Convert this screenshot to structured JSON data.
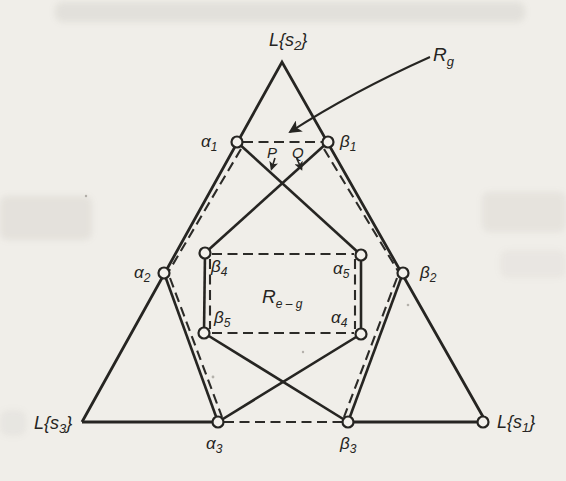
{
  "figure": {
    "title_hint": "Triangle diagram with regions R_g and R_e-g",
    "paper_color": "#f0eee9",
    "ink_color": "#262522",
    "vertex_labels": {
      "ls2": {
        "pre": "L{s",
        "sub": "2",
        "post": "}"
      },
      "ls3": {
        "pre": "L{s",
        "sub": "3",
        "post": "}"
      },
      "ls1": {
        "pre": "L{s",
        "sub": "1",
        "post": "}"
      }
    },
    "region_labels": {
      "rg": {
        "pre": "R",
        "sub": "g"
      },
      "reg": {
        "pre": "R",
        "sub": "e – g"
      }
    },
    "point_labels": {
      "alpha1": {
        "pre": "α",
        "sub": "1"
      },
      "beta1": {
        "pre": "β",
        "sub": "1"
      },
      "alpha2": {
        "pre": "α",
        "sub": "2"
      },
      "beta2": {
        "pre": "β",
        "sub": "2"
      },
      "alpha3": {
        "pre": "α",
        "sub": "3"
      },
      "beta3": {
        "pre": "β",
        "sub": "3"
      },
      "alpha4": {
        "pre": "α",
        "sub": "4"
      },
      "beta4": {
        "pre": "β",
        "sub": "4"
      },
      "alpha5": {
        "pre": "α",
        "sub": "5"
      },
      "beta5": {
        "pre": "β",
        "sub": "5"
      }
    },
    "pointer_labels": {
      "p": "P",
      "q": "Q"
    },
    "icons": {
      "rg_arrow": "curved-arrow-icon",
      "p_arrow": "small-arrow-icon",
      "q_arrow": "small-arrow-icon",
      "open_points": "open-circle-marker"
    }
  }
}
